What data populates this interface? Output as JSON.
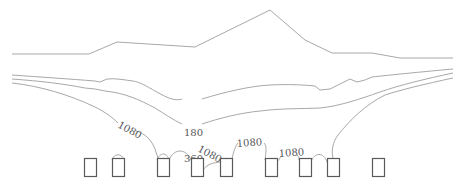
{
  "diagram": {
    "type": "contour-profile",
    "colors": {
      "line": "#a8a8a8",
      "box_stroke": "#5a5a5a",
      "label": "#555555",
      "background": "#ffffff"
    },
    "profile_line": {
      "points": [
        [
          12,
          54
        ],
        [
          89,
          54
        ],
        [
          117,
          42
        ],
        [
          195,
          47
        ],
        [
          270,
          10
        ],
        [
          305,
          40
        ],
        [
          332,
          53
        ],
        [
          372,
          53
        ],
        [
          400,
          58
        ],
        [
          453,
          58
        ]
      ]
    },
    "contours": [
      {
        "label": "180",
        "label_pos": [
          192,
          134
        ],
        "points": [
          [
            12,
            75
          ],
          [
            60,
            79
          ],
          [
            95,
            81
          ],
          [
            107,
            79
          ],
          [
            130,
            83
          ],
          [
            150,
            92
          ],
          [
            165,
            100
          ],
          [
            180,
            102
          ],
          [
            192,
            130
          ]
        ]
      },
      {
        "label": "360",
        "label_pos": [
          192,
          160
        ],
        "points": [
          [
            12,
            83
          ],
          [
            60,
            88
          ],
          [
            95,
            96
          ],
          [
            120,
            102
          ],
          [
            150,
            115
          ],
          [
            170,
            125
          ],
          [
            185,
            128
          ]
        ]
      },
      {
        "label": "1080",
        "label_pos": [
          122,
          131
        ],
        "points": [
          [
            12,
            88
          ],
          [
            40,
            94
          ],
          [
            80,
            110
          ],
          [
            110,
            123
          ]
        ]
      }
    ],
    "labels": [
      {
        "text": "180",
        "x": 184,
        "y": 136,
        "rotate": 0
      },
      {
        "text": "360",
        "x": 184,
        "y": 162,
        "rotate": 0
      },
      {
        "text": "1080",
        "x": 117,
        "y": 130,
        "rotate": 28
      },
      {
        "text": "1080",
        "x": 198,
        "y": 154,
        "rotate": 28
      },
      {
        "text": "1080",
        "x": 237,
        "y": 145,
        "rotate": -5
      },
      {
        "text": "1080",
        "x": 279,
        "y": 155,
        "rotate": -5
      }
    ],
    "boxes": [
      {
        "x": 84,
        "y": 158,
        "w": 12,
        "h": 18
      },
      {
        "x": 112,
        "y": 158,
        "w": 12,
        "h": 18
      },
      {
        "x": 157,
        "y": 158,
        "w": 12,
        "h": 18
      },
      {
        "x": 191,
        "y": 158,
        "w": 12,
        "h": 18
      },
      {
        "x": 220,
        "y": 158,
        "w": 12,
        "h": 18
      },
      {
        "x": 265,
        "y": 158,
        "w": 12,
        "h": 18
      },
      {
        "x": 299,
        "y": 158,
        "w": 12,
        "h": 18
      },
      {
        "x": 327,
        "y": 158,
        "w": 12,
        "h": 18
      },
      {
        "x": 372,
        "y": 158,
        "w": 12,
        "h": 18
      }
    ]
  }
}
